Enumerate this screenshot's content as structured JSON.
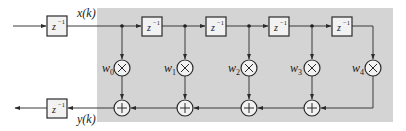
{
  "diagram": {
    "type": "FIR transversal filter (tapped delay line)",
    "colors": {
      "background": "#ffffff",
      "shaded_region": "#d4d4d4",
      "line": "#3a3a3a"
    },
    "input_delay": {
      "label": "z",
      "exp": "−1"
    },
    "output_delay": {
      "label": "z",
      "exp": "−1"
    },
    "input_signal": "x(k)",
    "output_signal": "y(k)",
    "delays": [
      {
        "label": "z",
        "exp": "−1"
      },
      {
        "label": "z",
        "exp": "−1"
      },
      {
        "label": "z",
        "exp": "−1"
      },
      {
        "label": "z",
        "exp": "−1"
      }
    ],
    "weights": [
      {
        "label": "w",
        "sub": "0"
      },
      {
        "label": "w",
        "sub": "1"
      },
      {
        "label": "w",
        "sub": "2"
      },
      {
        "label": "w",
        "sub": "3"
      },
      {
        "label": "w",
        "sub": "4"
      }
    ],
    "multiplier_symbol": "×",
    "adder_symbol": "+"
  }
}
